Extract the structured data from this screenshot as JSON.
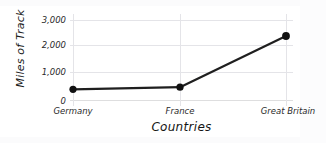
{
  "chart_data": {
    "type": "line",
    "title": "",
    "subtitle": "",
    "xlabel": "Countries",
    "ylabel": "Miles of Track",
    "categories": [
      "Germany",
      "France",
      "Great Britain"
    ],
    "values": [
      400,
      480,
      2400
    ],
    "series": [
      {
        "name": "Miles of Track",
        "values": [
          400,
          480,
          2400
        ]
      }
    ],
    "ytick_labels": [
      "0",
      "1,000",
      "2,000",
      "3,000"
    ],
    "ytick_values": [
      0,
      1000,
      2000,
      3000
    ],
    "ylim": [
      0,
      3200
    ],
    "grid": true,
    "legend": "none",
    "line_color": "#1f1f1f",
    "marker_color": "#111111",
    "gridline_color": "#e4e4e8",
    "background_color": "#ffffff"
  }
}
